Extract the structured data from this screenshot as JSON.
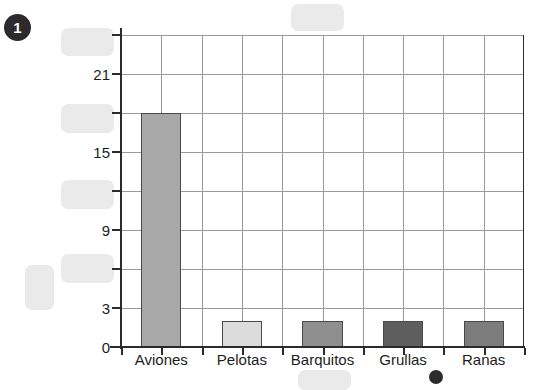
{
  "exercise": {
    "number": "1"
  },
  "chart_data": {
    "type": "bar",
    "title": "",
    "xlabel": "",
    "ylabel": "",
    "categories": [
      "Aviones",
      "Pelotas",
      "Barquitos",
      "Grullas",
      "Ranas"
    ],
    "values": [
      18,
      2,
      2,
      2,
      2
    ],
    "bar_colors": [
      "#a8a8a8",
      "#dcdcdc",
      "#8f8f8f",
      "#5e5e5e",
      "#7d7d7d"
    ],
    "ylim": [
      0,
      24
    ],
    "ytick_values": [
      0,
      3,
      6,
      9,
      12,
      15,
      18,
      21,
      24
    ],
    "ytick_labels": [
      "0",
      "3",
      "",
      "9",
      "",
      "15",
      "",
      "21",
      ""
    ],
    "visible_ytick_labels": [
      "0",
      "3",
      "9",
      "15",
      "21"
    ],
    "grid": true,
    "grid_step": 3,
    "legend": "none"
  },
  "redactions": {
    "blocks": [
      {
        "name": "y-label-24-redacted",
        "x": 61,
        "y": 28,
        "w": 53,
        "h": 28
      },
      {
        "name": "y-label-18-redacted",
        "x": 61,
        "y": 104,
        "w": 53,
        "h": 29
      },
      {
        "name": "y-label-12-redacted",
        "x": 61,
        "y": 180,
        "w": 53,
        "h": 29
      },
      {
        "name": "y-label-6-redacted",
        "x": 61,
        "y": 254,
        "w": 53,
        "h": 29
      },
      {
        "name": "y-axis-title-redacted",
        "x": 25,
        "y": 265,
        "w": 29,
        "h": 45
      },
      {
        "name": "chart-title-redacted",
        "x": 291,
        "y": 4,
        "w": 53,
        "h": 27
      },
      {
        "name": "caption-redacted",
        "x": 298,
        "y": 370,
        "w": 53,
        "h": 20
      }
    ],
    "dots": [
      {
        "name": "footer-dot-marker",
        "x": 429,
        "y": 370,
        "w": 14,
        "h": 14
      }
    ]
  }
}
